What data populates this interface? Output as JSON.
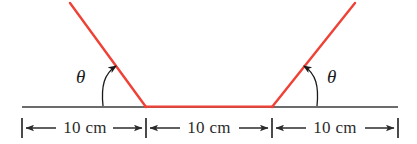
{
  "figure": {
    "background_color": "#ffffff",
    "width": 417,
    "height": 144
  },
  "colors": {
    "ramp_line": "#ef4136",
    "flat_line": "#ef4136",
    "baseline": "#6b6b6b",
    "dimension": "#2b2b2b",
    "text": "#1a1a1a"
  },
  "angles": {
    "left": {
      "symbol": "θ",
      "name": "theta-left"
    },
    "right": {
      "symbol": "θ",
      "name": "theta-right"
    }
  },
  "dimensions": {
    "segments": [
      {
        "label": "10 cm",
        "name": "left-segment"
      },
      {
        "label": "10 cm",
        "name": "middle-segment"
      },
      {
        "label": "10 cm",
        "name": "right-segment"
      }
    ]
  },
  "geometry": {
    "baseline": {
      "x1": 22,
      "y1": 107,
      "x2": 398,
      "y2": 107
    },
    "left_ramp": {
      "x1": 70,
      "y1": 3,
      "x2": 146,
      "y2": 107
    },
    "flat_top": {
      "x1": 146,
      "y1": 107,
      "x2": 272,
      "y2": 107
    },
    "right_ramp": {
      "x1": 272,
      "y1": 107,
      "x2": 355,
      "y2": 3
    },
    "tick_x": [
      22,
      146,
      272,
      398
    ],
    "dim_axis_y": 128
  }
}
